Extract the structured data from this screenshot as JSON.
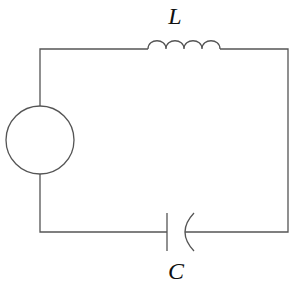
{
  "diagram": {
    "type": "LC circuit with AC source",
    "components": [
      {
        "id": "source",
        "kind": "ac-source",
        "label": ""
      },
      {
        "id": "inductor",
        "kind": "inductor",
        "label": "L"
      },
      {
        "id": "capacitor",
        "kind": "capacitor",
        "label": "C"
      }
    ],
    "labels": {
      "inductor": "L",
      "capacitor": "C"
    },
    "colors": {
      "wire": "#555555",
      "text": "#111111",
      "background": "#ffffff"
    }
  }
}
